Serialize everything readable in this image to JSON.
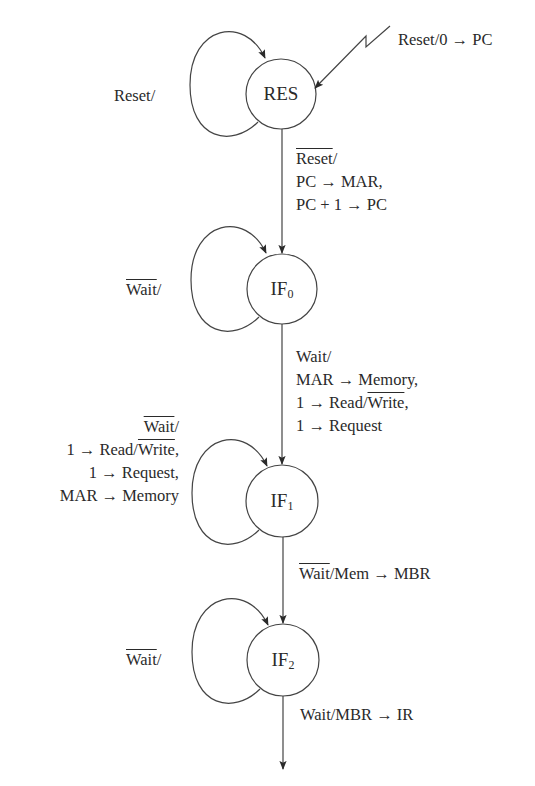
{
  "diagram": {
    "type": "state-machine",
    "states": [
      {
        "id": "RES",
        "label": "RES",
        "sub": ""
      },
      {
        "id": "IF0",
        "label": "IF",
        "sub": "0"
      },
      {
        "id": "IF1",
        "label": "IF",
        "sub": "1"
      },
      {
        "id": "IF2",
        "label": "IF",
        "sub": "2"
      }
    ],
    "reset_entry": {
      "label": "Reset/0 → PC"
    },
    "self_loops": {
      "RES": {
        "condition": "Reset",
        "slash": "/"
      },
      "IF0": {
        "condition": "Wait",
        "slash": "/",
        "negated": true
      },
      "IF1": {
        "condition": "Wait",
        "slash": "/",
        "negated": true,
        "actions": [
          {
            "pre": "1 → Read/",
            "neg": "Write",
            "post": ","
          },
          {
            "text": "1 → Request,"
          },
          {
            "text": "MAR → Memory"
          }
        ]
      },
      "IF2": {
        "condition": "Wait",
        "slash": "/",
        "negated": true
      }
    },
    "transitions": {
      "RES_IF0": {
        "condition": "Reset",
        "slash": "/",
        "negated": true,
        "actions": [
          "PC → MAR,",
          "PC + 1 → PC"
        ]
      },
      "IF0_IF1": {
        "condition": "Wait/",
        "actions": [
          {
            "text": "MAR → Memory,"
          },
          {
            "pre": "1 → Read/",
            "neg": "Write",
            "post": ","
          },
          {
            "text": "1 → Request"
          }
        ]
      },
      "IF1_IF2": {
        "condition": "Wait",
        "negated": true,
        "rest": "/Mem → MBR"
      },
      "IF2_out": {
        "label": "Wait/MBR → IR"
      }
    }
  }
}
